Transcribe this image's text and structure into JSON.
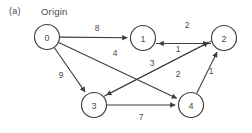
{
  "figure": {
    "panel_letter": "(a)",
    "origin_label": "Origin",
    "width": 252,
    "height": 133,
    "background": "#ffffff",
    "stroke_color": "#3d3d3d",
    "text_color": "#4a4a4a"
  },
  "chart_data": {
    "type": "diagram",
    "subtype": "directed-weighted-graph",
    "title": "",
    "panel": "(a)",
    "annotations": [
      {
        "text": "Origin",
        "target_node": "0",
        "x": 48,
        "y": 12
      },
      {
        "text": "(a)",
        "x": 14,
        "y": 12
      }
    ],
    "nodes": [
      {
        "id": "0",
        "label": "0",
        "x": 47,
        "y": 37,
        "r": 12.5
      },
      {
        "id": "1",
        "label": "1",
        "x": 143,
        "y": 38,
        "r": 12.5
      },
      {
        "id": "2",
        "label": "2",
        "x": 224,
        "y": 38,
        "r": 12.5
      },
      {
        "id": "3",
        "label": "3",
        "x": 94,
        "y": 105,
        "r": 12.5
      },
      {
        "id": "4",
        "label": "4",
        "x": 191,
        "y": 105,
        "r": 12.5
      }
    ],
    "edges": [
      {
        "from": "0",
        "to": "1",
        "weight": "8",
        "label_x": 97,
        "label_y": 28
      },
      {
        "from": "0",
        "to": "3",
        "weight": "9",
        "label_x": 61,
        "label_y": 75
      },
      {
        "from": "0",
        "to": "4",
        "weight": "4",
        "label_x": 115,
        "label_y": 53
      },
      {
        "from": "1",
        "to": "2",
        "weight": "1",
        "label_x": 178,
        "label_y": 49
      },
      {
        "from": "2",
        "to": "1",
        "weight": "2",
        "label_x": 187,
        "label_y": 25
      },
      {
        "from": "2",
        "to": "3",
        "weight": "3",
        "label_x": 152,
        "label_y": 63
      },
      {
        "from": "3",
        "to": "2",
        "weight": "2",
        "label_x": 178,
        "label_y": 74
      },
      {
        "from": "3",
        "to": "4",
        "weight": "7",
        "label_x": 141,
        "label_y": 117
      },
      {
        "from": "4",
        "to": "2",
        "weight": "1",
        "label_x": 211,
        "label_y": 71
      }
    ],
    "node_count": 5,
    "edge_count": 9,
    "directed": true,
    "weighted": true
  }
}
